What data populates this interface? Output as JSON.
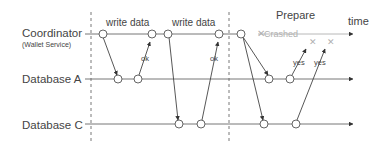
{
  "diagram": {
    "lanes": [
      {
        "id": "coordinator",
        "label": "Coordinator",
        "sublabel": "(Wallet Service)"
      },
      {
        "id": "db-a",
        "label": "Database A"
      },
      {
        "id": "db-c",
        "label": "Database C"
      }
    ],
    "phase_labels": {
      "write1": "write data",
      "write2": "write data",
      "prepare": "Prepare"
    },
    "axis_label": "time",
    "crash_label": "Crashed",
    "message_labels": {
      "ok_a": "ok",
      "ok_c": "ok",
      "yes_a": "yes",
      "yes_c": "yes"
    },
    "colors": {
      "line": "#555555",
      "crashed": "#b0b0b0",
      "text": "#444444"
    }
  }
}
